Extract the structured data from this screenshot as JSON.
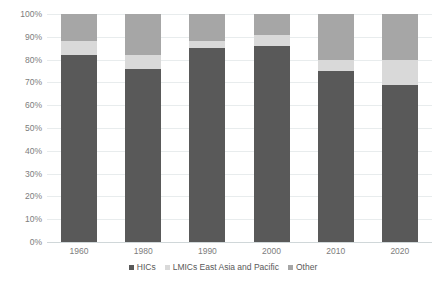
{
  "chart_data": {
    "type": "bar",
    "stacked": true,
    "title": "",
    "subtitle": "",
    "xlabel": "",
    "ylabel": "",
    "categories": [
      "1960",
      "1980",
      "1990",
      "2000",
      "2010",
      "2020"
    ],
    "series": [
      {
        "name": "HICs",
        "color": "#595959",
        "values": [
          82,
          76,
          85,
          86,
          75,
          69
        ]
      },
      {
        "name": "LMICs East Asia and Pacific",
        "color": "#d9d9d9",
        "values": [
          6,
          6,
          3,
          5,
          5,
          11
        ]
      },
      {
        "name": "Other",
        "color": "#a6a6a6",
        "values": [
          12,
          18,
          12,
          9,
          20,
          20
        ]
      }
    ],
    "ylim": [
      0,
      100
    ],
    "y_ticks": [
      "0%",
      "10%",
      "20%",
      "30%",
      "40%",
      "50%",
      "60%",
      "70%",
      "80%",
      "90%",
      "100%"
    ],
    "y_tick_values": [
      0,
      10,
      20,
      30,
      40,
      50,
      60,
      70,
      80,
      90,
      100
    ],
    "grid": true,
    "legend_position": "bottom",
    "legend_entries": [
      "HICs",
      "LMICs East Asia and Pacific",
      "Other"
    ]
  },
  "colors": {
    "hics": "#595959",
    "lmics_east_asia_and_pacific": "#d9d9d9",
    "other": "#a6a6a6",
    "gridline": "#e8eced",
    "axis_text": "#7d7d7d",
    "legend_text": "#595959",
    "background": "#ffffff"
  }
}
